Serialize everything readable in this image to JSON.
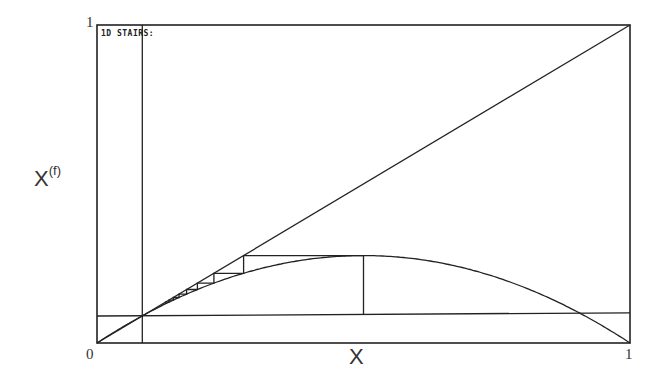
{
  "chart_data": {
    "type": "line",
    "title": "1D STAIRS:",
    "xlabel": "X",
    "ylabel": "X",
    "ylabel_superscript": "(f)",
    "xlim": [
      0,
      1
    ],
    "ylim": [
      0,
      1
    ],
    "x_ticks": [
      "0",
      "1"
    ],
    "y_ticks": [
      "1"
    ],
    "grid": false,
    "series": [
      {
        "name": "identity",
        "kind": "line",
        "points": [
          [
            0,
            0
          ],
          [
            1,
            1
          ]
        ]
      },
      {
        "name": "map f(x) = r*x*(1-x)",
        "kind": "curve",
        "r": 1.1,
        "peak": [
          0.5,
          0.277
        ]
      },
      {
        "name": "fixed point vertical",
        "kind": "line",
        "points": [
          [
            0.085,
            0
          ],
          [
            0.085,
            1
          ]
        ]
      },
      {
        "name": "fixed point horizontal",
        "kind": "line",
        "points": [
          [
            0,
            0.085
          ],
          [
            1,
            0.095
          ]
        ]
      },
      {
        "name": "cobweb stairs",
        "kind": "cobweb",
        "start_x": 0.5,
        "steps": 8
      }
    ]
  },
  "labels": {
    "title": "1D STAIRS:",
    "x_axis": "X",
    "y_axis": "X",
    "y_axis_sup": "(f)",
    "tick_x0": "0",
    "tick_x1": "1",
    "tick_y1": "1"
  }
}
